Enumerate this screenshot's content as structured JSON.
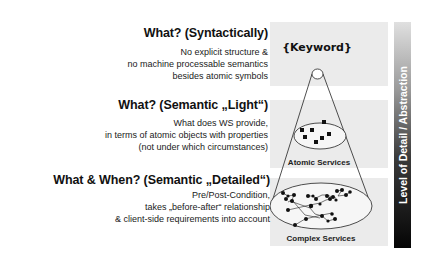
{
  "levels": [
    {
      "heading": "What? (Syntactically)",
      "lines": [
        "No explicit structure &",
        "no machine processable semantics",
        "besides atomic symbols"
      ]
    },
    {
      "heading": "What? (Semantic „Light“)",
      "lines": [
        "What does WS provide,",
        "in terms of atomic objects with properties",
        "(not under which circumstances)"
      ]
    },
    {
      "heading": "What & When? (Semantic „Detailed“)",
      "lines": [
        "Pre/Post-Condition,",
        "takes „before-after“ relationship",
        "& client-side requirements into account"
      ]
    }
  ],
  "diagram": {
    "keyword_label": "{Keyword}",
    "atomic_label": "Atomic Services",
    "complex_label": "Complex Services"
  },
  "axis": {
    "label": "Level of Detail / Abstraction"
  },
  "colors": {
    "band": "#ebebeb",
    "gradient_top": "#e0e0e0",
    "gradient_bottom": "#050505"
  }
}
